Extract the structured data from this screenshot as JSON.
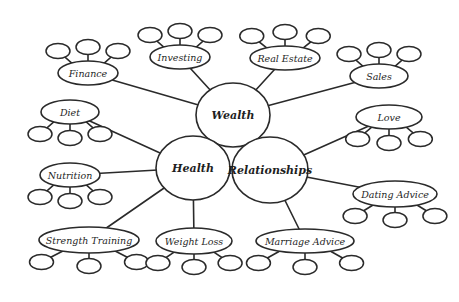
{
  "diagram": {
    "type": "mind-map",
    "background": "#ffffff",
    "stroke_color": "#2a2a2a",
    "central_nodes": [
      {
        "id": "wealth",
        "label": "Wealth",
        "cx": 233,
        "cy": 115,
        "rx": 37,
        "ry": 32
      },
      {
        "id": "health",
        "label": "Health",
        "cx": 193,
        "cy": 168,
        "rx": 37,
        "ry": 32
      },
      {
        "id": "relationships",
        "label": "Relationships",
        "cx": 270,
        "cy": 170,
        "rx": 38,
        "ry": 33
      }
    ],
    "branches": [
      {
        "id": "finance",
        "label": "Finance",
        "parent": "wealth",
        "cx": 88,
        "cy": 73,
        "rx": 30,
        "ry": 12,
        "leaves": "up"
      },
      {
        "id": "investing",
        "label": "Investing",
        "parent": "wealth",
        "cx": 180,
        "cy": 57,
        "rx": 30,
        "ry": 12,
        "leaves": "up"
      },
      {
        "id": "real-estate",
        "label": "Real Estate",
        "parent": "wealth",
        "cx": 285,
        "cy": 58,
        "rx": 35,
        "ry": 12,
        "leaves": "up"
      },
      {
        "id": "sales",
        "label": "Sales",
        "parent": "wealth",
        "cx": 379,
        "cy": 76,
        "rx": 29,
        "ry": 12,
        "leaves": "up"
      },
      {
        "id": "diet",
        "label": "Diet",
        "parent": "health",
        "cx": 70,
        "cy": 112,
        "rx": 29,
        "ry": 12,
        "leaves": "down"
      },
      {
        "id": "nutrition",
        "label": "Nutrition",
        "parent": "health",
        "cx": 70,
        "cy": 175,
        "rx": 30,
        "ry": 12,
        "leaves": "down"
      },
      {
        "id": "strength-training",
        "label": "Strength Training",
        "parent": "health",
        "cx": 89,
        "cy": 240,
        "rx": 50,
        "ry": 13,
        "leaves": "down"
      },
      {
        "id": "weight-loss",
        "label": "Weight Loss",
        "parent": "health",
        "cx": 194,
        "cy": 241,
        "rx": 38,
        "ry": 13,
        "leaves": "down"
      },
      {
        "id": "love",
        "label": "Love",
        "parent": "relationships",
        "cx": 389,
        "cy": 117,
        "rx": 33,
        "ry": 12,
        "leaves": "down"
      },
      {
        "id": "dating-advice",
        "label": "Dating Advice",
        "parent": "relationships",
        "cx": 395,
        "cy": 194,
        "rx": 42,
        "ry": 13,
        "leaves": "down"
      },
      {
        "id": "marriage-advice",
        "label": "Marriage Advice",
        "parent": "relationships",
        "cx": 305,
        "cy": 241,
        "rx": 49,
        "ry": 12,
        "leaves": "down"
      }
    ],
    "leaves_per_branch": 3
  }
}
